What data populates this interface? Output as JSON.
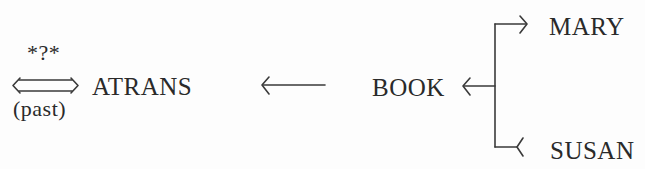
{
  "diagram": {
    "type": "conceptual-dependency",
    "nodes": {
      "tense_marker": "*?*",
      "tense": "(past)",
      "primitive_act": "ATRANS",
      "object": "BOOK",
      "recipient_to": "MARY",
      "recipient_from": "SUSAN"
    },
    "relations": [
      {
        "from": "actor(unknown)",
        "to": "ATRANS",
        "arrow": "double-headed",
        "label_above": "*?*",
        "label_below": "(past)"
      },
      {
        "from": "BOOK",
        "to": "ATRANS",
        "arrow": "single-headed-left",
        "meaning": "object"
      },
      {
        "from": "recipient-case",
        "to": "BOOK",
        "arrow": "single-headed-left",
        "meaning": "recipient"
      },
      {
        "from": "recipient-case",
        "to": "MARY",
        "arrow": "to-arrowhead",
        "meaning": "to"
      },
      {
        "from": "SUSAN",
        "to": "recipient-case",
        "arrow": "from-fork-tail",
        "meaning": "from"
      }
    ],
    "colors": {
      "background": "#fdfdfd",
      "ink": "#2a2a2a"
    }
  }
}
